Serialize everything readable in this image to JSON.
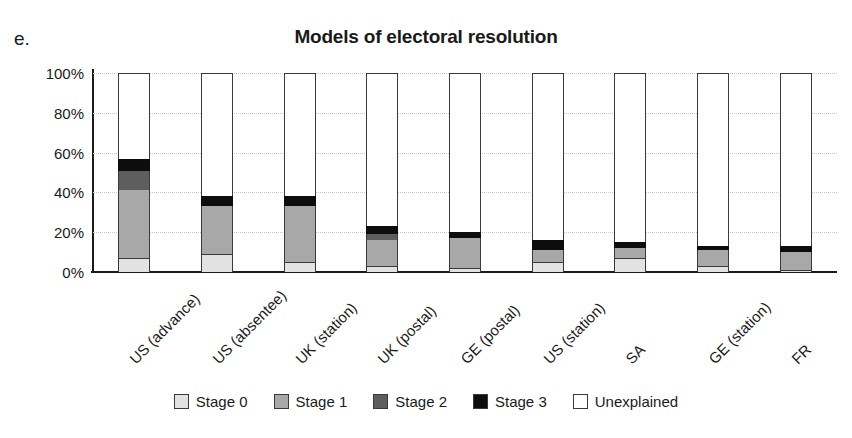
{
  "panel": {
    "letter": "e."
  },
  "chart_data": {
    "type": "bar",
    "subtype": "stacked-bar-100pct",
    "title": "Models of electoral resolution",
    "xlabel": "",
    "ylabel": "",
    "ylim": [
      0,
      100
    ],
    "yticks": [
      "0%",
      "20%",
      "40%",
      "60%",
      "80%",
      "100%"
    ],
    "ytick_values": [
      0,
      20,
      40,
      60,
      80,
      100
    ],
    "grid": true,
    "grid_style": "dotted-horizontal",
    "legend_position": "bottom",
    "categories": [
      "US (advance)",
      "US (absentee)",
      "UK (station)",
      "UK (postal)",
      "GE (postal)",
      "US (station)",
      "SA",
      "GE (station)",
      "FR"
    ],
    "series": [
      {
        "name": "Stage 0",
        "color": "#e2e2e2",
        "values": [
          7,
          9,
          5,
          3,
          2,
          5,
          7,
          3,
          1
        ]
      },
      {
        "name": "Stage 1",
        "color": "#a8a8a8",
        "values": [
          34,
          24,
          28,
          13,
          15,
          6,
          5,
          8,
          9
        ]
      },
      {
        "name": "Stage 2",
        "color": "#5e5e5e",
        "values": [
          10,
          0,
          0,
          3,
          0,
          0,
          0,
          0,
          0
        ]
      },
      {
        "name": "Stage 3",
        "color": "#0d0d0d",
        "values": [
          6,
          5,
          5,
          4,
          3,
          5,
          3,
          2,
          3
        ]
      },
      {
        "name": "Unexplained",
        "color": "#ffffff",
        "values": [
          43,
          62,
          62,
          77,
          80,
          84,
          85,
          87,
          87
        ]
      }
    ]
  },
  "legend": {
    "items": [
      {
        "label": "Stage 0",
        "color": "#e2e2e2"
      },
      {
        "label": "Stage 1",
        "color": "#a8a8a8"
      },
      {
        "label": "Stage 2",
        "color": "#5e5e5e"
      },
      {
        "label": "Stage 3",
        "color": "#0d0d0d"
      },
      {
        "label": "Unexplained",
        "color": "#ffffff"
      }
    ]
  }
}
